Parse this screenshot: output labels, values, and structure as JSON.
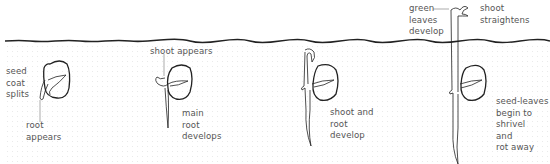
{
  "diagram": {
    "colors": {
      "line": "#222222",
      "text": "#555555",
      "soil_dots": "#d8d8d8"
    },
    "stages": [
      {
        "id": 1,
        "labels": {
          "left": "seed\ncoat\nsplits",
          "bottom": "root\nappears"
        }
      },
      {
        "id": 2,
        "labels": {
          "top": "shoot appears",
          "right": "main\nroot\ndevelops"
        }
      },
      {
        "id": 3,
        "labels": {
          "right": "shoot and\nroot\ndevelop"
        }
      },
      {
        "id": 4,
        "labels": {
          "top_left": "green\nleaves\ndevelop",
          "top_right": "shoot\nstraightens",
          "right": "seed-leaves\nbegin to\nshrivel\nand\nrot away"
        }
      }
    ],
    "soil_surface_label": ""
  }
}
